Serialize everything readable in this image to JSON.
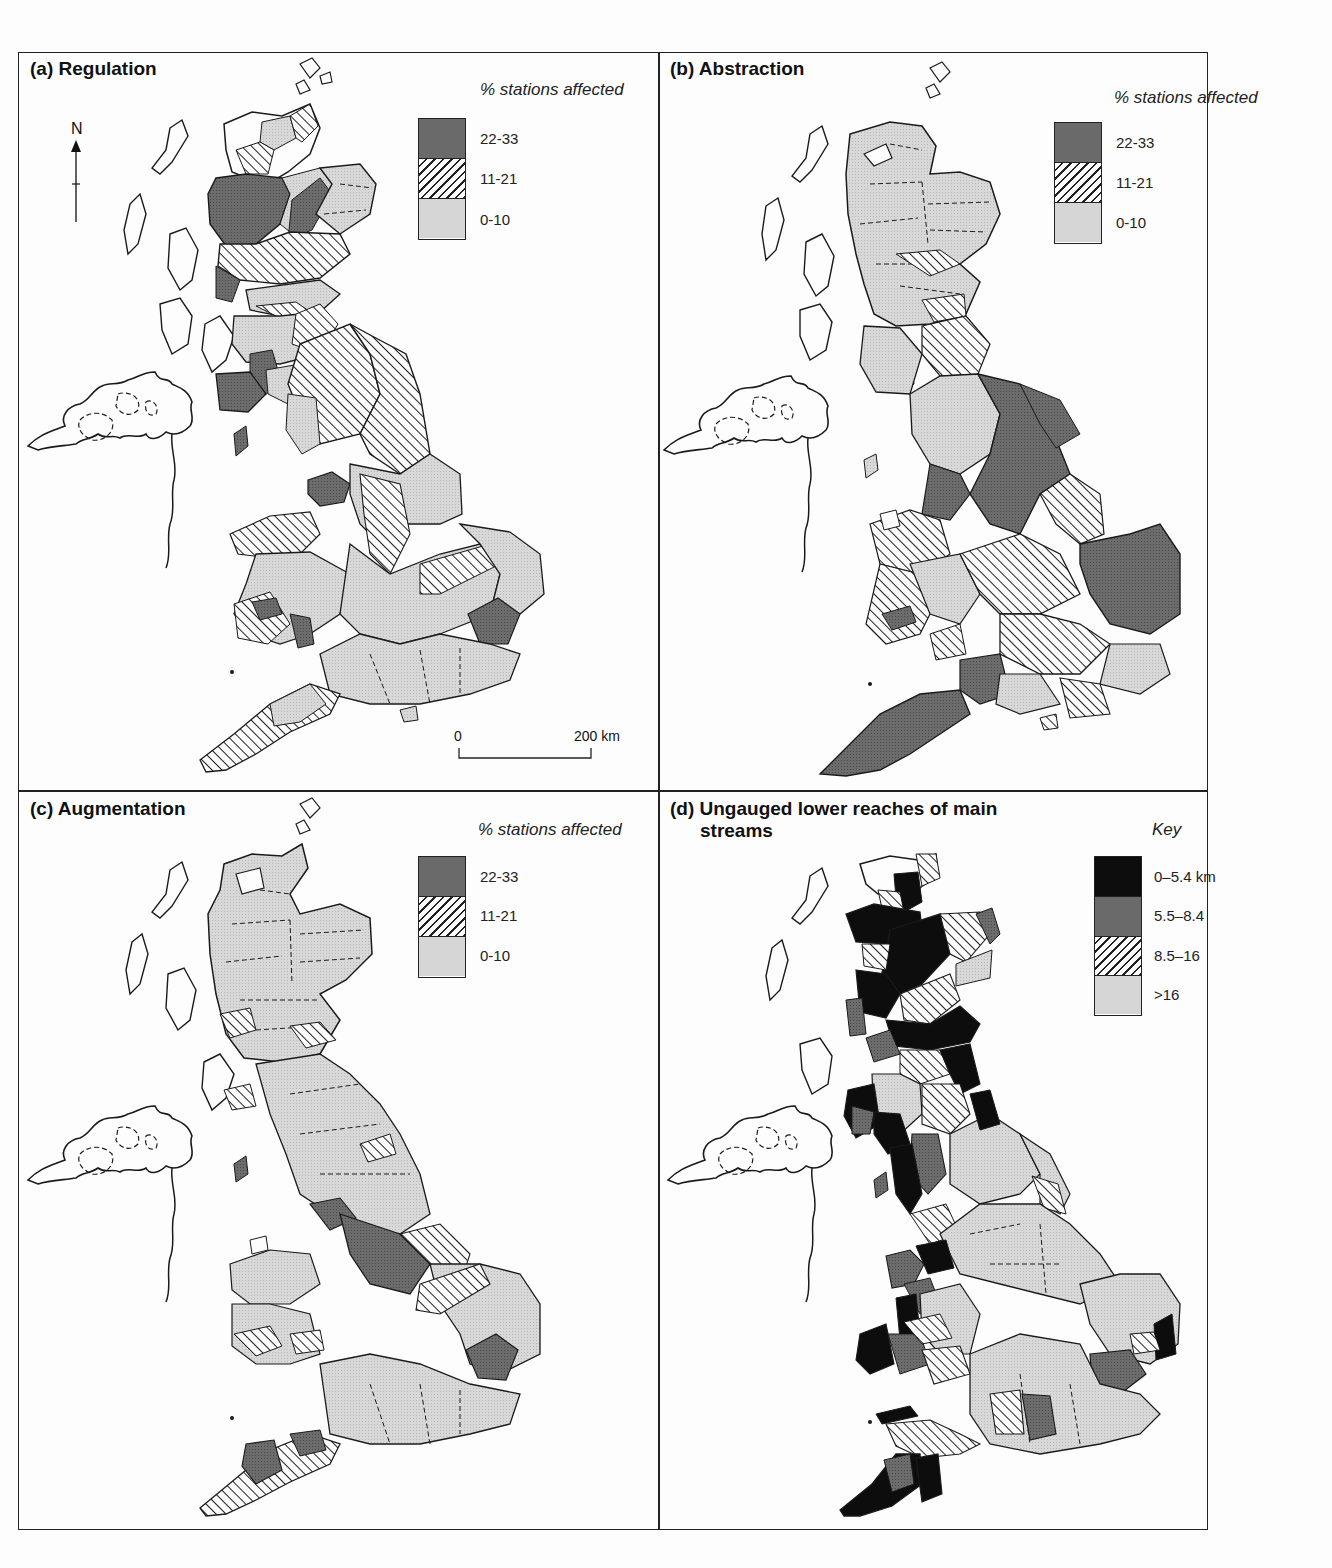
{
  "figure": {
    "panels": [
      {
        "id": "a",
        "title": "(a) Regulation",
        "legend_title": "% stations affected",
        "legend": [
          {
            "label": "22-33",
            "fill": "dark-stipple"
          },
          {
            "label": "11-21",
            "fill": "hatch"
          },
          {
            "label": "0-10",
            "fill": "light-stipple"
          }
        ],
        "north_label": "N",
        "scale": {
          "start": "0",
          "end": "200 km"
        }
      },
      {
        "id": "b",
        "title": "(b) Abstraction",
        "legend_title": "% stations affected",
        "legend": [
          {
            "label": "22-33",
            "fill": "dark-stipple"
          },
          {
            "label": "11-21",
            "fill": "hatch"
          },
          {
            "label": "0-10",
            "fill": "light-stipple"
          }
        ]
      },
      {
        "id": "c",
        "title": "(c) Augmentation",
        "legend_title": "% stations affected",
        "legend": [
          {
            "label": "22-33",
            "fill": "dark-stipple"
          },
          {
            "label": "11-21",
            "fill": "hatch"
          },
          {
            "label": "0-10",
            "fill": "light-stipple"
          }
        ]
      },
      {
        "id": "d",
        "title_line1": "(d) Ungauged lower reaches of main",
        "title_line2": "streams",
        "legend_title": "Key",
        "legend": [
          {
            "label": "0–5.4 km",
            "fill": "black"
          },
          {
            "label": "5.5–8.4",
            "fill": "dark-stipple"
          },
          {
            "label": "8.5–16",
            "fill": "hatch"
          },
          {
            "label": ">16",
            "fill": "light-stipple"
          }
        ]
      }
    ],
    "colors": {
      "black": "#0d0d0d",
      "dark_stipple": "#6a6a6a",
      "light_stipple": "#d6d6d6",
      "hatch_line": "#222222",
      "outline": "#1a1a1a",
      "background": "#fdfdfd"
    }
  },
  "map_data": {
    "type": "choropleth",
    "region": "Great Britain (river catchments)",
    "panels": {
      "a_regulation": {
        "dominant": "0-10",
        "notable_22_33": [
          "Northern Highlands (Ness/Beauly)",
          "Tay",
          "Clyde area",
          "Solway/Galloway",
          "Isle of Man",
          "Mersey/Dee (NW England)",
          "South Wales (Towy, Taff)",
          "Essex/Thames estuary"
        ],
        "notable_11_21": [
          "Tweed/Northumberland",
          "Yorkshire Ouse / Trent",
          "North Wales",
          "Severn (upper)",
          "Great Ouse",
          "Devon/Cornwall"
        ]
      },
      "b_abstraction": {
        "dominant": "0-10 in Scotland",
        "notable_22_33": [
          "Yorkshire/Trent",
          "Mersey",
          "East Anglia",
          "Essex",
          "Devon/Cornwall",
          "Thames (upper)",
          "Eden/Lune"
        ],
        "notable_11_21": [
          "Severn",
          "Lincolnshire",
          "Thames",
          "Kent/Sussex",
          "North Wales",
          "Tyne"
        ]
      },
      "c_augmentation": {
        "dominant": "0-10",
        "notable_22_33": [
          "Trent",
          "Mersey",
          "Essex",
          "Devon/Cornwall",
          "Isle of Man"
        ],
        "notable_11_21": [
          "Great Ouse/Nene",
          "Lincolnshire",
          "Solway",
          "Clyde",
          "Cornwall",
          "South Wales"
        ]
      },
      "d_ungauged": {
        "notable_0_5_4": [
          "Northwest Highlands",
          "Moray",
          "Forth",
          "Tweed coast",
          "Galloway",
          "Cumbria",
          "Lancashire",
          "North Wales",
          "Pembroke",
          "Norfolk coast",
          "Cornwall/Devon"
        ],
        "notable_5_5_8_4": [
          "Aberdeenshire",
          "Clyde",
          "Solway",
          "Isle of Man",
          "Anglesey/Wales",
          "Essex",
          "Hampshire",
          "Devon"
        ],
        "notable_8_5_16": [
          "Highland interior",
          "Tay",
          "Tweed",
          "Ribble",
          "Lincolnshire",
          "South Wales",
          "Somerset",
          "Dorset"
        ],
        "notable_gt16": [
          "English Midlands",
          "Thames",
          "East Anglia",
          "Yorkshire"
        ]
      }
    }
  }
}
